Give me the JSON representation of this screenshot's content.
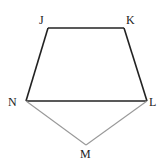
{
  "diagram": {
    "vertices": [
      {
        "id": "J",
        "label": "J"
      },
      {
        "id": "K",
        "label": "K"
      },
      {
        "id": "L",
        "label": "L"
      },
      {
        "id": "M",
        "label": "M"
      },
      {
        "id": "N",
        "label": "N"
      }
    ],
    "edges": [
      {
        "from": "J",
        "to": "K",
        "style": "dark"
      },
      {
        "from": "K",
        "to": "L",
        "style": "dark"
      },
      {
        "from": "L",
        "to": "N",
        "style": "dark"
      },
      {
        "from": "N",
        "to": "J",
        "style": "dark"
      },
      {
        "from": "N",
        "to": "M",
        "style": "light"
      },
      {
        "from": "M",
        "to": "L",
        "style": "light"
      }
    ],
    "colors": {
      "dark": "#222222",
      "light": "#999999"
    }
  }
}
